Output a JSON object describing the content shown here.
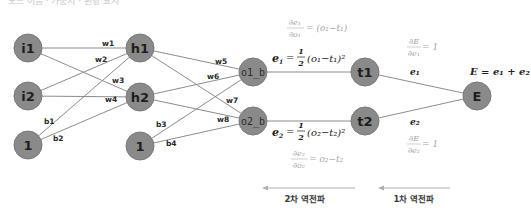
{
  "diagram": {
    "top_caption_cutoff": "노드 이름 · 가중치 · 편향 표시",
    "nodes": {
      "i1": {
        "label": "i1"
      },
      "i2": {
        "label": "i2"
      },
      "bias1": {
        "label": "1"
      },
      "h1": {
        "label": "h1"
      },
      "h2": {
        "label": "h2"
      },
      "bias2": {
        "label": "1"
      },
      "o1": {
        "label": "o1_b"
      },
      "o2": {
        "label": "o2_b"
      },
      "t1": {
        "label": "t1"
      },
      "t2": {
        "label": "t2"
      },
      "E": {
        "label": "E"
      }
    },
    "weights": {
      "w1": "w1",
      "w2": "w2",
      "w3": "w3",
      "w4": "w4",
      "w5": "w5",
      "w6": "w6",
      "w7": "w7",
      "w8": "w8",
      "b1": "b1",
      "b2": "b2",
      "b3": "b3",
      "b4": "b4"
    },
    "equations": {
      "e1_def_lhs": "e",
      "e1_def_sub": "1",
      "e1_def_eq": "=",
      "e1_def_half_num": "1",
      "e1_def_half_den": "2",
      "e1_def_rhs": "(o₁−t₁)²",
      "de1_do1_num": "∂e₁",
      "de1_do1_den": "∂o₁",
      "de1_do1_rhs": "= (o₁−t₁)",
      "e2_def_lhs": "e",
      "e2_def_sub": "2",
      "e2_def_eq": "=",
      "e2_def_half_num": "1",
      "e2_def_half_den": "2",
      "e2_def_rhs": "(o₂−t₂)²",
      "de2_do2_num": "∂e₂",
      "de2_do2_den": "∂o₂",
      "de2_do2_rhs": "= o₂−t₂",
      "dE_de1_num": "∂E",
      "dE_de1_den": "∂e₁",
      "dE_de1_rhs": "= 1",
      "dE_de2_num": "∂E",
      "dE_de2_den": "∂e₂",
      "dE_de2_rhs": "= 1",
      "e1_edge": "e₁",
      "e2_edge": "e₂",
      "E_def": "E = e₁ + e₂"
    },
    "backprop": {
      "second": "2차 역전파",
      "first": "1차 역전파"
    },
    "colors": {
      "node_fill": "#8a8a8a",
      "edge": "#8c8c8c",
      "light_math": "#a8a8a8",
      "arrow": "#b0b0b0"
    }
  }
}
